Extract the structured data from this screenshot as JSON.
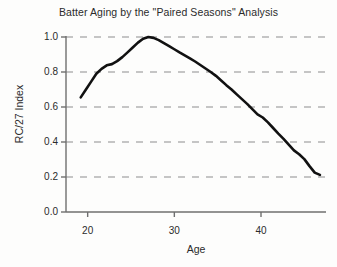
{
  "chart_data": {
    "type": "line",
    "title": "Batter Aging by the \"Paired Seasons\" Analysis",
    "xlabel": "Age",
    "ylabel": "RC/27 Index",
    "xlim": [
      17.5,
      47.5
    ],
    "ylim": [
      0.0,
      1.0
    ],
    "xticks": [
      20,
      30,
      40
    ],
    "xtick_labels": [
      "20",
      "30",
      "40"
    ],
    "yticks": [
      0.0,
      0.2,
      0.4,
      0.6,
      0.8,
      1.0
    ],
    "ytick_labels": [
      "0.0",
      "0.2",
      "0.4",
      "0.6",
      "0.8",
      "1.0"
    ],
    "grid": "horizontal-dashed",
    "legend": null,
    "series": [
      {
        "name": "RC/27 Index",
        "color": "#111111",
        "x": [
          19.2,
          19.8,
          20.4,
          21.0,
          21.6,
          22.2,
          22.8,
          23.4,
          24.0,
          24.6,
          25.2,
          25.8,
          26.4,
          27.0,
          27.6,
          28.2,
          28.8,
          29.4,
          30.0,
          30.6,
          31.2,
          31.8,
          32.4,
          33.0,
          33.6,
          34.2,
          34.8,
          35.4,
          36.0,
          36.6,
          37.2,
          37.8,
          38.4,
          39.0,
          39.6,
          40.2,
          40.8,
          41.4,
          42.0,
          42.6,
          43.2,
          43.8,
          44.4,
          45.0,
          45.6,
          46.2,
          46.8
        ],
        "y": [
          0.655,
          0.7,
          0.745,
          0.79,
          0.818,
          0.838,
          0.845,
          0.862,
          0.885,
          0.912,
          0.94,
          0.968,
          0.99,
          1.0,
          0.995,
          0.982,
          0.965,
          0.948,
          0.93,
          0.912,
          0.895,
          0.878,
          0.86,
          0.84,
          0.82,
          0.8,
          0.778,
          0.752,
          0.725,
          0.7,
          0.672,
          0.645,
          0.618,
          0.588,
          0.558,
          0.54,
          0.512,
          0.48,
          0.448,
          0.418,
          0.385,
          0.352,
          0.33,
          0.302,
          0.262,
          0.225,
          0.212
        ]
      }
    ]
  }
}
